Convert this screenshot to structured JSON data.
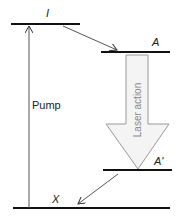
{
  "diagram": {
    "type": "energy-level-diagram",
    "levels": [
      {
        "id": "I",
        "label": "I"
      },
      {
        "id": "A",
        "label": "A"
      },
      {
        "id": "A_prime",
        "label": "A'"
      },
      {
        "id": "X",
        "label": "X"
      }
    ],
    "transitions": [
      {
        "from": "X",
        "to": "I",
        "label": "Pump"
      },
      {
        "from": "I",
        "to": "A",
        "label": ""
      },
      {
        "from": "A",
        "to": "A_prime",
        "label": "Laser action"
      },
      {
        "from": "A_prime",
        "to": "X",
        "label": ""
      }
    ],
    "colors": {
      "line": "#111111",
      "arrow": "#555555",
      "laser_fill": "#f4f4f4",
      "laser_stroke": "#999999",
      "laser_text": "#888888"
    }
  }
}
